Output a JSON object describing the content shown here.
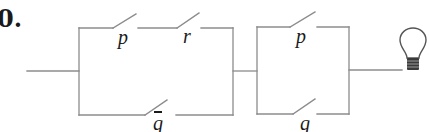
{
  "problem": {
    "number": "0."
  },
  "colors": {
    "wire": "#8c8c8c",
    "text": "#1a1a1a",
    "background": "#ffffff"
  },
  "circuit": {
    "description": "Two parallel blocks in series feeding a light bulb",
    "block1": {
      "top_branch": [
        {
          "label": "p",
          "negated": false
        },
        {
          "label": "r",
          "negated": false
        }
      ],
      "bottom_branch": [
        {
          "label": "q",
          "negated": true
        }
      ]
    },
    "block2": {
      "top_branch": [
        {
          "label": "p",
          "negated": false
        }
      ],
      "bottom_branch": [
        {
          "label": "q",
          "negated": false
        }
      ]
    },
    "output": "light-bulb"
  }
}
